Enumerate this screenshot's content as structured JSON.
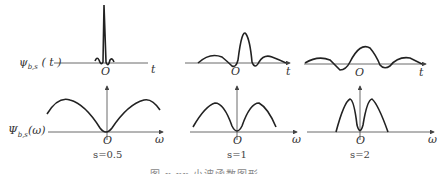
{
  "labels": {
    "psi_t": "ψ",
    "psi_t_sub": "b,s",
    "psi_t_arg": "( t )",
    "Psi_w": "Ψ",
    "Psi_w_sub": "b,s",
    "Psi_w_arg": "(ω)",
    "origin": "O",
    "t_axis": "t",
    "w_axis": "ω"
  },
  "panels": [
    {
      "scale": "s=0.5"
    },
    {
      "scale": "s=1"
    },
    {
      "scale": "s=2"
    }
  ],
  "figure_caption": "图 x.xx  小波函数图形",
  "colors": {
    "curve": "#222222",
    "axis": "#444444"
  }
}
